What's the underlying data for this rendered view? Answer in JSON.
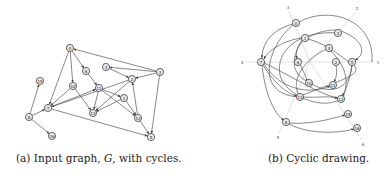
{
  "figure": {
    "subfigures": [
      {
        "id": "a",
        "caption_prefix": "(a) Input graph, ",
        "caption_var": "G",
        "caption_suffix": ", with cycles.",
        "nodes": [
          {
            "id": "n0",
            "label": "0",
            "x": 70,
            "y": 48
          },
          {
            "id": "n4",
            "label": "4",
            "x": 106,
            "y": 67
          },
          {
            "id": "n6",
            "label": "6",
            "x": 86,
            "y": 71
          },
          {
            "id": "n3",
            "label": "3",
            "x": 160,
            "y": 72
          },
          {
            "id": "n2",
            "label": "2",
            "x": 132,
            "y": 79
          },
          {
            "id": "n15",
            "label": "15",
            "x": 40,
            "y": 81
          },
          {
            "id": "n10",
            "label": "10",
            "x": 73,
            "y": 86
          },
          {
            "id": "n11",
            "label": "11",
            "x": 99,
            "y": 88
          },
          {
            "id": "n1",
            "label": "1",
            "x": 124,
            "y": 98
          },
          {
            "id": "n7",
            "label": "7",
            "x": 48,
            "y": 108
          },
          {
            "id": "n13",
            "label": "13",
            "x": 93,
            "y": 113
          },
          {
            "id": "n8",
            "label": "8",
            "x": 29,
            "y": 117
          },
          {
            "id": "n12",
            "label": "12",
            "x": 138,
            "y": 118
          },
          {
            "id": "n16",
            "label": "16",
            "x": 52,
            "y": 136
          },
          {
            "id": "n5",
            "label": "5",
            "x": 151,
            "y": 137
          }
        ],
        "edges": [
          [
            "n3",
            "n0"
          ],
          [
            "n0",
            "n6"
          ],
          [
            "n0",
            "n10"
          ],
          [
            "n0",
            "n7"
          ],
          [
            "n3",
            "n4"
          ],
          [
            "n4",
            "n2"
          ],
          [
            "n3",
            "n2"
          ],
          [
            "n3",
            "n5"
          ],
          [
            "n6",
            "n11"
          ],
          [
            "n11",
            "n13"
          ],
          [
            "n10",
            "n13"
          ],
          [
            "n10",
            "n7"
          ],
          [
            "n2",
            "n7"
          ],
          [
            "n2",
            "n13"
          ],
          [
            "n11",
            "n12"
          ],
          [
            "n1",
            "n12"
          ],
          [
            "n12",
            "n2"
          ],
          [
            "n12",
            "n5"
          ],
          [
            "n7",
            "n5"
          ],
          [
            "n7",
            "n11"
          ],
          [
            "n8",
            "n7"
          ],
          [
            "n8",
            "n15"
          ],
          [
            "n8",
            "n16"
          ],
          [
            "n1",
            "n13"
          ],
          [
            "n11",
            "n1"
          ]
        ]
      },
      {
        "id": "b",
        "caption": "(b) Cyclic drawing.",
        "axis_labels": [
          "1",
          "2",
          "3",
          "4",
          "5",
          "6"
        ],
        "nodes": [
          {
            "id": "m0",
            "label": "0",
            "x": 296,
            "y": 23
          },
          {
            "id": "m3",
            "label": "3",
            "x": 338,
            "y": 33
          },
          {
            "id": "m1",
            "label": "1",
            "x": 305,
            "y": 38
          },
          {
            "id": "m4",
            "label": "4",
            "x": 329,
            "y": 48
          },
          {
            "id": "m7",
            "label": "7",
            "x": 261,
            "y": 62
          },
          {
            "id": "m6",
            "label": "6",
            "x": 298,
            "y": 62
          },
          {
            "id": "m2",
            "label": "2",
            "x": 336,
            "y": 62
          },
          {
            "id": "m5",
            "label": "5",
            "x": 352,
            "y": 62
          },
          {
            "id": "m10",
            "label": "10",
            "x": 309,
            "y": 83
          },
          {
            "id": "m11",
            "label": "11",
            "x": 333,
            "y": 85
          },
          {
            "id": "m13",
            "label": "13",
            "x": 300,
            "y": 97
          },
          {
            "id": "m12",
            "label": "12",
            "x": 341,
            "y": 99
          },
          {
            "id": "m15",
            "label": "15",
            "x": 348,
            "y": 114
          },
          {
            "id": "m8",
            "label": "8",
            "x": 286,
            "y": 122
          },
          {
            "id": "m16",
            "label": "16",
            "x": 357,
            "y": 128
          }
        ]
      }
    ]
  }
}
